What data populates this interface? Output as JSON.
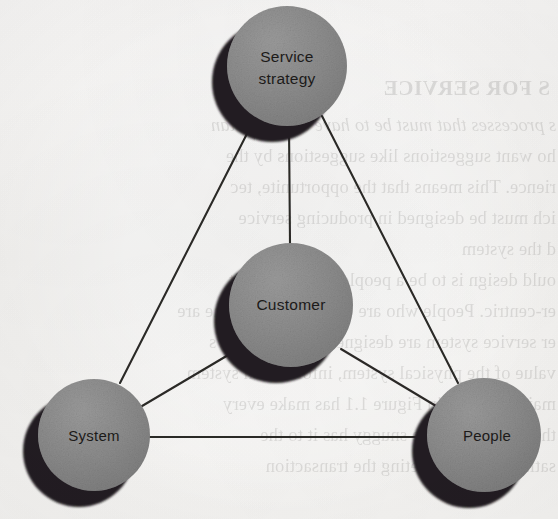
{
  "page": {
    "type": "scanned-book-page-figure",
    "background_color": "#f6f5f3",
    "width": 558,
    "height": 519
  },
  "diagram": {
    "node_fill_color": "#8d8d8d",
    "node_shadow_color": "#231f20",
    "line_color": "#2b2927",
    "label_color": "#1c1a19",
    "nodes": [
      {
        "id": "service-strategy",
        "label_line1": "Service",
        "label_line2": "strategy",
        "cx": 287,
        "cy": 66,
        "r": 60
      },
      {
        "id": "customer",
        "label_line1": "Customer",
        "label_line2": "",
        "cx": 291,
        "cy": 305,
        "r": 62
      },
      {
        "id": "system",
        "label_line1": "System",
        "label_line2": "",
        "cx": 94,
        "cy": 435,
        "r": 56
      },
      {
        "id": "people",
        "label_line1": "People",
        "label_line2": "",
        "cx": 484,
        "cy": 435,
        "r": 57
      }
    ],
    "edges": [
      {
        "from": "service-strategy",
        "to": "system"
      },
      {
        "from": "service-strategy",
        "to": "people"
      },
      {
        "from": "service-strategy",
        "to": "customer"
      },
      {
        "from": "system",
        "to": "people"
      },
      {
        "from": "system",
        "to": "customer"
      },
      {
        "from": "people",
        "to": "customer"
      }
    ]
  },
  "bleed_through_text": {
    "note": "faint mirrored text showing through from the reverse side of the page",
    "heading": "S FOR SERVICE",
    "lines": [
      "s processes that must be to have an understan",
      "ho want suggestions like suggestions by the",
      "rience. This means that the opportunite, tec",
      "ich must be designed in producing service",
      "d the system",
      "ould design is to be a people should benefit",
      "er-centric. People who are complements of the are",
      "er service system are designed to make all sys",
      "value of the physical system, information system",
      "main elements in Figure 1.1 has make every",
      "the customer to the snuggy has it to the",
      "satisfaction by meeting the transaction"
    ]
  }
}
